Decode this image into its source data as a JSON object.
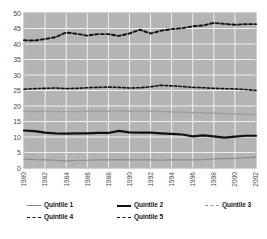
{
  "chart_data": {
    "type": "line",
    "title": "",
    "xlabel": "",
    "ylabel": "",
    "xlim": [
      1980,
      2002
    ],
    "ylim": [
      0,
      50
    ],
    "ytick_values": [
      0,
      5,
      10,
      15,
      20,
      25,
      30,
      35,
      40,
      45,
      50
    ],
    "ytick_labels": [
      "0",
      "5",
      "10",
      "15",
      "20",
      "25",
      "30",
      "35",
      "40",
      "45",
      "50"
    ],
    "xtick_values": [
      1980,
      1982,
      1984,
      1986,
      1988,
      1990,
      1992,
      1994,
      1996,
      1998,
      2000,
      2002
    ],
    "xtick_labels": [
      "1980",
      "1982",
      "1984",
      "1986",
      "1988",
      "1990",
      "1992",
      "1994",
      "1996",
      "1998",
      "2000",
      "2002"
    ],
    "grid": true,
    "grid_color": "#ffffff",
    "plot_background": "#b4b4b4",
    "legend_position": "bottom",
    "x": [
      1980,
      1981,
      1982,
      1983,
      1984,
      1985,
      1986,
      1987,
      1988,
      1989,
      1990,
      1991,
      1992,
      1993,
      1994,
      1995,
      1996,
      1997,
      1998,
      1999,
      2000,
      2001,
      2002
    ],
    "series": [
      {
        "name": "Quintile 1",
        "color": "#8a8a8a",
        "style": "solid",
        "width": 1.2,
        "values": [
          2.9,
          2.7,
          2.6,
          2.5,
          2.2,
          2.5,
          2.5,
          2.6,
          2.6,
          2.7,
          2.6,
          2.6,
          2.6,
          2.5,
          2.6,
          2.6,
          2.6,
          2.7,
          2.9,
          3.0,
          3.1,
          3.3,
          3.5
        ]
      },
      {
        "name": "Quintile 2",
        "color": "#111111",
        "style": "solid",
        "width": 2.2,
        "values": [
          12.1,
          11.9,
          11.4,
          11.2,
          11.1,
          11.2,
          11.2,
          11.3,
          11.3,
          12.0,
          11.5,
          11.4,
          11.4,
          11.2,
          11.0,
          10.8,
          10.2,
          10.5,
          10.2,
          9.8,
          10.1,
          10.4,
          10.4
        ]
      },
      {
        "name": "Quintile 3",
        "color": "#9a9a9a",
        "style": "dashed",
        "width": 1.4,
        "values": [
          18.3,
          18.2,
          18.3,
          18.2,
          18.2,
          18.2,
          18.3,
          18.3,
          18.3,
          18.5,
          18.3,
          18.4,
          18.3,
          18.2,
          18.1,
          18.0,
          17.8,
          17.8,
          17.7,
          17.5,
          17.4,
          17.3,
          17.2
        ]
      },
      {
        "name": "Quintile 4",
        "color": "#111111",
        "style": "dashed",
        "width": 1.6,
        "values": [
          25.4,
          25.6,
          25.7,
          25.8,
          25.6,
          25.7,
          25.9,
          26.0,
          26.1,
          26.0,
          25.8,
          25.9,
          26.2,
          26.7,
          26.5,
          26.3,
          26.0,
          25.9,
          25.7,
          25.6,
          25.5,
          25.3,
          25.0
        ]
      },
      {
        "name": "Quintile 5",
        "color": "#111111",
        "style": "dashed",
        "width": 1.9,
        "values": [
          41.2,
          41.1,
          41.6,
          42.2,
          43.7,
          43.3,
          42.7,
          43.2,
          43.2,
          42.6,
          43.4,
          44.6,
          43.4,
          44.3,
          44.8,
          45.1,
          45.7,
          46.0,
          46.8,
          46.5,
          46.2,
          46.4,
          46.4
        ]
      }
    ]
  },
  "legend": {
    "items": [
      {
        "label": "Quintile 1"
      },
      {
        "label": "Quintile 2"
      },
      {
        "label": "Quintile 3"
      },
      {
        "label": "Quintile 4"
      },
      {
        "label": "Quintile 5"
      }
    ]
  },
  "caption": {
    "text": ""
  }
}
